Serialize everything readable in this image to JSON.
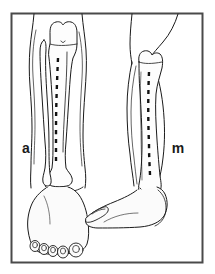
{
  "figure": {
    "panel_count": 2
  },
  "frame": {
    "border_color": "#4a4a4a",
    "border_width_px": 2,
    "background_color": "#ffffff",
    "x": 11,
    "y": 13,
    "width": 192,
    "height": 250
  },
  "style": {
    "outline_color": "#1a1a1a",
    "outline_width_px": 1,
    "fill_color": "#fbfbfb",
    "bone_fill_color": "#fdfdfd",
    "dash_color": "#111111",
    "dash_width_px": 2.4,
    "dash_pattern": "4 5"
  },
  "panels": [
    {
      "id": "anterior",
      "label": "a",
      "label_meaning": "anterior view",
      "label_x": 26,
      "label_y": 148,
      "view": "anterior",
      "structures": [
        "leg-silhouette",
        "tibia",
        "fibula",
        "ankle-joint",
        "foot-dorsum",
        "toes",
        "toenails"
      ],
      "toe_count": 5,
      "incision": {
        "name": "anteromedial-incision",
        "style": "dashed",
        "top_y": 58,
        "bottom_y": 162
      }
    },
    {
      "id": "medial",
      "label": "m",
      "label_meaning": "medial view",
      "label_x": 176,
      "label_y": 148,
      "view": "medial",
      "structures": [
        "leg-silhouette",
        "tibia",
        "ankle-joint",
        "foot-profile",
        "great-toe",
        "heel"
      ],
      "toe_count": 1,
      "incision": {
        "name": "medial-incision",
        "style": "dashed",
        "top_y": 72,
        "bottom_y": 176
      }
    }
  ],
  "labels": {
    "anterior_label": "a",
    "medial_label": "m"
  }
}
